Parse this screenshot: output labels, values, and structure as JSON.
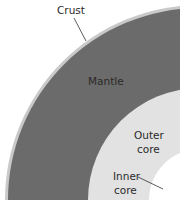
{
  "diagram": {
    "layers": [
      {
        "name": "Crust",
        "color": "#c9c9c9"
      },
      {
        "name": "Mantle",
        "color": "#6b6b6b"
      },
      {
        "name": "Outer core",
        "color": "#e2e2e2"
      },
      {
        "name": "Inner core",
        "color": "#ffffff"
      }
    ],
    "labels": {
      "crust": "Crust",
      "mantle": "Mantle",
      "outer_core_line1": "Outer",
      "outer_core_line2": "core",
      "inner_core_line1": "Inner",
      "inner_core_line2": "core"
    }
  }
}
